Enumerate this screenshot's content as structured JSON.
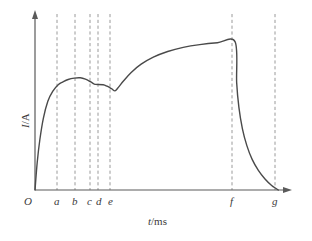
{
  "figure": {
    "name": "current-vs-time-graph",
    "background_color": "#ffffff",
    "curve_color": "#4a4a4a",
    "axis_color": "#5a5a5a",
    "dash_color": "#9a9a9a"
  },
  "axes": {
    "x_title_var": "t",
    "x_title_unit": "/ms",
    "y_title_var": "I",
    "y_title_unit": "/A",
    "origin_label": "O"
  },
  "chart_data": {
    "type": "line",
    "title": "",
    "subtitle": "",
    "xlabel": "t/ms",
    "ylabel": "I/A",
    "grid": false,
    "legend": "none",
    "axis_arrows": true,
    "xlim": [
      0,
      9
    ],
    "ylim": [
      0,
      1.15
    ],
    "xtick_labels": [
      "O",
      "a",
      "b",
      "c",
      "d",
      "e",
      "f",
      "g"
    ],
    "xtick_values": [
      0,
      1.25,
      2.05,
      2.72,
      3.08,
      3.62,
      9.05,
      11.0
    ],
    "ytick_labels": [],
    "annotations": [],
    "markers": {
      "dashed_verticals": [
        {
          "label": "a",
          "x": 1.25
        },
        {
          "label": "b",
          "x": 2.05
        },
        {
          "label": "c",
          "x": 2.72
        },
        {
          "label": "d",
          "x": 3.08
        },
        {
          "label": "e",
          "x": 3.62
        },
        {
          "label": "f",
          "x": 9.05
        },
        {
          "label": "g",
          "x": 11.0
        }
      ]
    },
    "series": [
      {
        "name": "current",
        "style": "solid",
        "points": [
          {
            "x": 0.0,
            "y": 0.0
          },
          {
            "x": 0.1,
            "y": 0.18
          },
          {
            "x": 0.22,
            "y": 0.33
          },
          {
            "x": 0.38,
            "y": 0.47
          },
          {
            "x": 0.58,
            "y": 0.58
          },
          {
            "x": 0.8,
            "y": 0.645
          },
          {
            "x": 1.05,
            "y": 0.688
          },
          {
            "x": 1.25,
            "y": 0.705
          },
          {
            "x": 1.5,
            "y": 0.722
          },
          {
            "x": 1.78,
            "y": 0.731
          },
          {
            "x": 2.05,
            "y": 0.733
          },
          {
            "x": 2.28,
            "y": 0.724
          },
          {
            "x": 2.5,
            "y": 0.708
          },
          {
            "x": 2.66,
            "y": 0.694
          },
          {
            "x": 2.72,
            "y": 0.69
          },
          {
            "x": 3.08,
            "y": 0.688
          },
          {
            "x": 3.26,
            "y": 0.678
          },
          {
            "x": 3.46,
            "y": 0.662
          },
          {
            "x": 3.62,
            "y": 0.648
          },
          {
            "x": 3.78,
            "y": 0.672
          },
          {
            "x": 4.0,
            "y": 0.712
          },
          {
            "x": 4.35,
            "y": 0.768
          },
          {
            "x": 4.8,
            "y": 0.822
          },
          {
            "x": 5.35,
            "y": 0.868
          },
          {
            "x": 6.0,
            "y": 0.905
          },
          {
            "x": 6.7,
            "y": 0.932
          },
          {
            "x": 7.45,
            "y": 0.95
          },
          {
            "x": 8.25,
            "y": 0.962
          },
          {
            "x": 9.05,
            "y": 0.968
          },
          {
            "x": 9.12,
            "y": 0.7
          },
          {
            "x": 9.22,
            "y": 0.54
          },
          {
            "x": 9.38,
            "y": 0.4
          },
          {
            "x": 9.58,
            "y": 0.29
          },
          {
            "x": 9.82,
            "y": 0.2
          },
          {
            "x": 10.1,
            "y": 0.128
          },
          {
            "x": 10.4,
            "y": 0.072
          },
          {
            "x": 10.7,
            "y": 0.03
          },
          {
            "x": 10.9,
            "y": 0.01
          },
          {
            "x": 11.0,
            "y": 0.0
          }
        ]
      }
    ]
  },
  "tick_positions_px": {
    "a": 57,
    "b": 75,
    "c": 90,
    "d": 98,
    "e": 110,
    "f": 232,
    "g": 275
  }
}
